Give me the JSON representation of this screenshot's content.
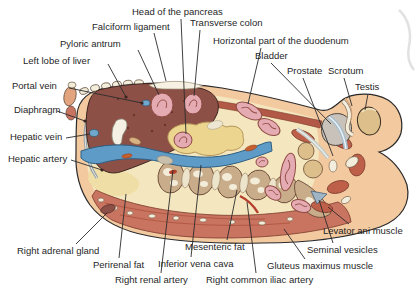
{
  "figure": {
    "type": "anatomical-cross-section-diagram",
    "labels": [
      {
        "id": "head-of-the-pancreas",
        "text": "Head of the pancreas",
        "x": 132,
        "y": 7,
        "line": [
          181,
          19,
          186,
          134
        ],
        "dot": false
      },
      {
        "id": "falciform-ligament",
        "text": "Falciform ligament",
        "x": 92,
        "y": 22,
        "line": [
          154,
          33,
          166,
          81
        ],
        "dot": false
      },
      {
        "id": "transverse-colon",
        "text": "Transverse colon",
        "x": 190,
        "y": 18,
        "line": [
          200,
          30,
          194,
          96
        ],
        "dot": false
      },
      {
        "id": "pyloric-antrum",
        "text": "Pyloric antrum",
        "x": 60,
        "y": 39,
        "line": [
          138,
          50,
          159,
          95
        ],
        "dot": false
      },
      {
        "id": "horizontal-part-of-the-duodenum",
        "text": "Horizontal part of the duodenum",
        "x": 213,
        "y": 36,
        "line": [
          261,
          48,
          248,
          104
        ],
        "dot": false
      },
      {
        "id": "left-lobe-of-liver",
        "text": "Left lobe of liver",
        "x": 23,
        "y": 56,
        "line": [
          108,
          64,
          126,
          97
        ],
        "dot": true
      },
      {
        "id": "bladder",
        "text": "Bladder",
        "x": 255,
        "y": 51,
        "line": [
          271,
          63,
          331,
          124
        ],
        "dot": false
      },
      {
        "id": "prostate",
        "text": "Prostate",
        "x": 287,
        "y": 66,
        "line": [
          303,
          78,
          333,
          156
        ],
        "dot": false
      },
      {
        "id": "scrotum",
        "text": "Scrotum",
        "x": 328,
        "y": 66,
        "line": [
          344,
          78,
          352,
          106
        ],
        "dot": false
      },
      {
        "id": "testis",
        "text": "Testis",
        "x": 355,
        "y": 82,
        "line": [
          368,
          94,
          365,
          110
        ],
        "dot": false
      },
      {
        "id": "portal-vein",
        "text": "Portal vein",
        "x": 12,
        "y": 81,
        "line": [
          69,
          88,
          142,
          103
        ],
        "dot": true
      },
      {
        "id": "diaphragm",
        "text": "Diaphragm",
        "x": 14,
        "y": 105,
        "line": [
          57,
          111,
          85,
          121
        ],
        "dot": true
      },
      {
        "id": "hepatic-vein",
        "text": "Hepatic vein",
        "x": 10,
        "y": 132,
        "line": [
          66,
          138,
          90,
          134
        ],
        "dot": false
      },
      {
        "id": "hepatic-artery",
        "text": "Hepatic artery",
        "x": 8,
        "y": 154,
        "line": [
          71,
          160,
          102,
          170
        ],
        "dot": true
      },
      {
        "id": "right-adrenal-gland",
        "text": "Right adrenal gland",
        "x": 17,
        "y": 246,
        "line": [
          76,
          244,
          107,
          213
        ],
        "dot": false
      },
      {
        "id": "perirenal-fat",
        "text": "Perirenal fat",
        "x": 93,
        "y": 260,
        "line": [
          119,
          258,
          126,
          194
        ],
        "dot": false
      },
      {
        "id": "right-renal-artery",
        "text": "Right renal artery",
        "x": 115,
        "y": 275,
        "line": [
          161,
          273,
          173,
          170
        ],
        "dot": false
      },
      {
        "id": "inferior-vena-cava",
        "text": "Inferior vena cava",
        "x": 158,
        "y": 259,
        "line": [
          191,
          257,
          201,
          165
        ],
        "dot": false
      },
      {
        "id": "mesenteric-fat",
        "text": "Mesenteric fat",
        "x": 185,
        "y": 242,
        "line": [
          227,
          240,
          237,
          190
        ],
        "dot": false
      },
      {
        "id": "right-common-iliac-artery",
        "text": "Right common iliac artery",
        "x": 206,
        "y": 275,
        "line": [
          256,
          273,
          247,
          202
        ],
        "dot": false
      },
      {
        "id": "gluteus-maximus-muscle",
        "text": "Gluteus maximus muscle",
        "x": 267,
        "y": 261,
        "line": [
          305,
          259,
          284,
          229
        ],
        "dot": false
      },
      {
        "id": "seminal-vesicles",
        "text": "Seminal vesicles",
        "x": 307,
        "y": 245,
        "line": [
          333,
          243,
          319,
          200
        ],
        "dot": false
      },
      {
        "id": "levator-ani-muscle",
        "text": "Levator ani muscle",
        "x": 323,
        "y": 226,
        "line": [
          349,
          224,
          328,
          207
        ],
        "dot": false
      }
    ]
  },
  "palette": {
    "skin": "#F3C9A0",
    "cavity": "#F4E6BE",
    "muscle": "#C97361",
    "muscle_deep": "#B25847",
    "liver": "#8D5047",
    "vein": "#5E9CC7",
    "pancreas": "#ECD68F",
    "bowel": "#E5ABB2",
    "bowel_line": "#8E4A42",
    "bone_tan": "#C9AC8A",
    "bone_cream": "#F2ECD9",
    "bladder": "#C8C2BA",
    "testis": "#DCBF8A",
    "fat_yellow": "#EFDFA6",
    "label_text": "#1F1F1F",
    "leader": "#2B2B2B"
  }
}
